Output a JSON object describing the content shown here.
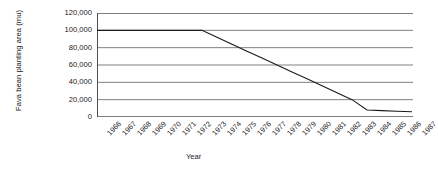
{
  "chart_data": {
    "type": "line",
    "title": "",
    "xlabel": "Year",
    "ylabel": "Fava bean planting area (mu)",
    "x": [
      1966,
      1967,
      1968,
      1969,
      1970,
      1971,
      1972,
      1973,
      1974,
      1975,
      1976,
      1977,
      1978,
      1979,
      1980,
      1981,
      1982,
      1983,
      1984,
      1985,
      1986,
      1987
    ],
    "categories": [
      "1966",
      "1967",
      "1968",
      "1969",
      "1970",
      "1971",
      "1972",
      "1973",
      "1974",
      "1975",
      "1976",
      "1977",
      "1978",
      "1979",
      "1980",
      "1981",
      "1982",
      "1983",
      "1984",
      "1985",
      "1986",
      "1987"
    ],
    "values": [
      100000,
      100000,
      100000,
      100000,
      100000,
      100000,
      100000,
      100000,
      92000,
      84000,
      76000,
      68000,
      60000,
      52000,
      44000,
      36000,
      28000,
      20000,
      8000,
      7300,
      6600,
      6000
    ],
    "series": [
      {
        "name": "Fava bean planting area",
        "values": [
          100000,
          100000,
          100000,
          100000,
          100000,
          100000,
          100000,
          100000,
          92000,
          84000,
          76000,
          68000,
          60000,
          52000,
          44000,
          36000,
          28000,
          20000,
          8000,
          7300,
          6600,
          6000
        ]
      }
    ],
    "ylim": [
      0,
      120000
    ],
    "yticks": [
      0,
      20000,
      40000,
      60000,
      80000,
      100000,
      120000
    ],
    "ytick_labels": [
      "0",
      "20,000",
      "40,000",
      "60,000",
      "80,000",
      "100,000",
      "120,000"
    ],
    "grid": true,
    "grid_axis": "y",
    "legend": false,
    "colors": {
      "line": "#1a1a1a",
      "grid": "#808080",
      "axis": "#4d4d4d",
      "background": "#ffffff"
    }
  }
}
